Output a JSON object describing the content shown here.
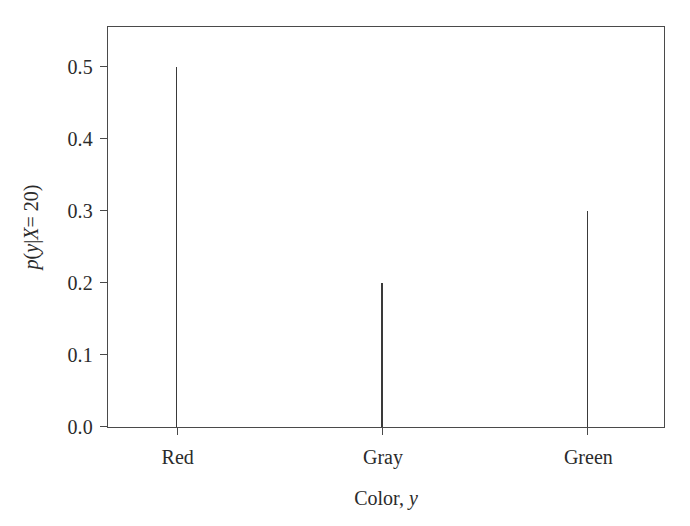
{
  "figure": {
    "background_color": "#ffffff",
    "axis_color": "#4a4a4a",
    "stem_color": "#3a3a3a"
  },
  "axes": {
    "y_title_parts": {
      "p": "p",
      "open_paren": "(",
      "y": "y",
      "bar": "|",
      "X": "X",
      "equals": " = 20)"
    },
    "y_title_plain": "p(y|X = 20)",
    "x_title_parts": {
      "text": "Color,",
      "var": "y"
    },
    "x_title_plain": "Color, y",
    "y_ticks": [
      "0.0",
      "0.1",
      "0.2",
      "0.3",
      "0.4",
      "0.5"
    ],
    "y_tick_values": [
      0.0,
      0.1,
      0.2,
      0.3,
      0.4,
      0.5
    ],
    "x_ticks": [
      "Red",
      "Gray",
      "Green"
    ]
  },
  "chart_data": {
    "type": "bar",
    "title": "",
    "subtitle": "",
    "categories": [
      "Red",
      "Gray",
      "Green"
    ],
    "values": [
      0.5,
      0.2,
      0.3
    ],
    "series": [
      {
        "name": "p(y|X = 20)",
        "values": [
          0.5,
          0.2,
          0.3
        ]
      }
    ],
    "xlabel": "Color, y",
    "ylabel": "p(y|X = 20)",
    "ylim": [
      0.0,
      0.5555
    ],
    "yticks": [
      0.0,
      0.1,
      0.2,
      0.3,
      0.4,
      0.5
    ],
    "ytick_labels": [
      "0.0",
      "0.1",
      "0.2",
      "0.3",
      "0.4",
      "0.5"
    ],
    "xtick_labels": [
      "Red",
      "Gray",
      "Green"
    ],
    "grid": false,
    "legend": "none",
    "style": "stem",
    "annotations": []
  }
}
